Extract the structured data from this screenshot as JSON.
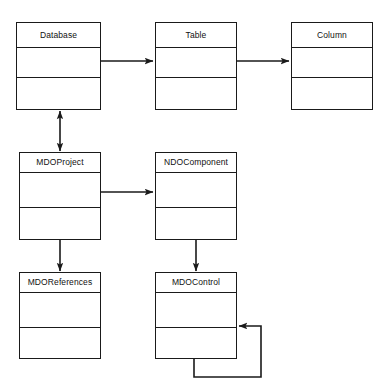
{
  "diagram": {
    "background_color": "#ffffff",
    "line_color": "#1a1a1a",
    "text_color": "#111111",
    "classes": [
      {
        "id": "database",
        "name": "Database",
        "x": 16,
        "y": 22,
        "w": 85,
        "h": 88,
        "name_h": 25,
        "attr_h": 30
      },
      {
        "id": "table",
        "name": "Table",
        "x": 155,
        "y": 22,
        "w": 82,
        "h": 88,
        "name_h": 25,
        "attr_h": 30
      },
      {
        "id": "column",
        "name": "Column",
        "x": 291,
        "y": 22,
        "w": 82,
        "h": 88,
        "name_h": 25,
        "attr_h": 30
      },
      {
        "id": "mdoproject",
        "name": "MDOProject",
        "x": 19,
        "y": 152,
        "w": 82,
        "h": 88,
        "name_h": 20,
        "attr_h": 35
      },
      {
        "id": "ndocomponent",
        "name": "NDOComponent",
        "x": 155,
        "y": 152,
        "w": 82,
        "h": 88,
        "name_h": 20,
        "attr_h": 35
      },
      {
        "id": "mdoreferences",
        "name": "MDOReferences",
        "x": 19,
        "y": 272,
        "w": 82,
        "h": 87,
        "name_h": 20,
        "attr_h": 35
      },
      {
        "id": "mdocontrol",
        "name": "MDOControl",
        "x": 155,
        "y": 272,
        "w": 82,
        "h": 87,
        "name_h": 20,
        "attr_h": 35
      }
    ],
    "connectors": [
      {
        "id": "database-to-table",
        "from": "database",
        "to": "table",
        "kind": "association-arrow",
        "direction": "right",
        "points": "101,61 155,61"
      },
      {
        "id": "table-to-column",
        "from": "table",
        "to": "column",
        "kind": "association-arrow",
        "direction": "right",
        "points": "237,61 291,61"
      },
      {
        "id": "database-to-mdoproject",
        "from": "database",
        "to": "mdoproject",
        "kind": "bidirectional-arrow",
        "direction": "vertical-both",
        "points": "60,110 60,152"
      },
      {
        "id": "mdoproject-to-ndocomponent",
        "from": "mdoproject",
        "to": "ndocomponent",
        "kind": "association-arrow",
        "direction": "right",
        "points": "101,192 155,192"
      },
      {
        "id": "mdoproject-to-mdoreferences",
        "from": "mdoproject",
        "to": "mdoreferences",
        "kind": "association-arrow",
        "direction": "down",
        "points": "60,240 60,272"
      },
      {
        "id": "ndocomponent-to-mdocontrol",
        "from": "ndocomponent",
        "to": "mdocontrol",
        "kind": "association-arrow",
        "direction": "down",
        "points": "196,240 196,272"
      },
      {
        "id": "mdocontrol-self-loop",
        "from": "mdocontrol",
        "to": "mdocontrol",
        "kind": "self-loop-arrow",
        "direction": "left",
        "points": "194,359 194,377 261,377 261,326 237,326"
      }
    ]
  }
}
